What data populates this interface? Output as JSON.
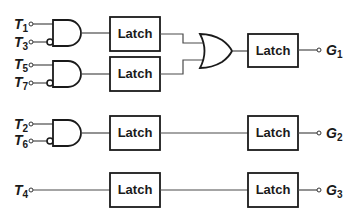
{
  "diagram": {
    "type": "logic-circuit",
    "block_label": "Latch",
    "inputs": [
      {
        "name": "T",
        "sub": "1"
      },
      {
        "name": "T",
        "sub": "3"
      },
      {
        "name": "T",
        "sub": "5"
      },
      {
        "name": "T",
        "sub": "7"
      },
      {
        "name": "T",
        "sub": "2"
      },
      {
        "name": "T",
        "sub": "6"
      },
      {
        "name": "T",
        "sub": "4"
      }
    ],
    "outputs": [
      {
        "name": "G",
        "sub": "1"
      },
      {
        "name": "G",
        "sub": "2"
      },
      {
        "name": "G",
        "sub": "3"
      }
    ],
    "latches": [
      "Latch",
      "Latch",
      "Latch",
      "Latch",
      "Latch",
      "Latch",
      "Latch"
    ],
    "gates": [
      {
        "type": "AND",
        "inputs": [
          "T1",
          "NOT T3"
        ]
      },
      {
        "type": "AND",
        "inputs": [
          "T5",
          "NOT T7"
        ]
      },
      {
        "type": "OR",
        "inputs": [
          "Latch(AND1)",
          "Latch(AND2)"
        ]
      },
      {
        "type": "AND",
        "inputs": [
          "T2",
          "NOT T6"
        ]
      }
    ]
  }
}
